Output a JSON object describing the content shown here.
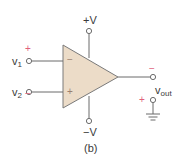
{
  "figure": {
    "caption": "(b)",
    "component": "op-amp",
    "colors": {
      "body_fill": "#ecdcc8",
      "line": "#6b6b6b",
      "polarity_red": "#e0607a",
      "polarity_gray": "#9a9a9a",
      "text": "#3a3a3a"
    },
    "supply": {
      "positive_label": "+V",
      "negative_label": "−V"
    },
    "inputs": [
      {
        "name": "v",
        "subscript": "1",
        "outer_sign": "+",
        "pin_sign": "−"
      },
      {
        "name": "v",
        "subscript": "2",
        "outer_sign": "−",
        "pin_sign": "+"
      }
    ],
    "output": {
      "name": "v",
      "subscript": "out",
      "top_sign": "−",
      "bottom_sign": "+"
    }
  }
}
